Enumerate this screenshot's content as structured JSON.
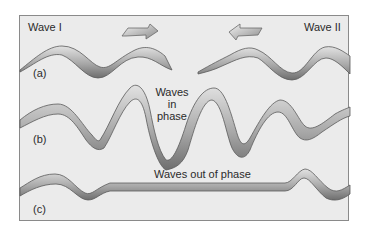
{
  "figure": {
    "labels": {
      "wave_1": "Wave I",
      "wave_2": "Wave II",
      "panel_a": "(a)",
      "panel_b": "(b)",
      "panel_c": "(c)",
      "in_phase_line1": "Waves",
      "in_phase_line2": "in",
      "in_phase_line3": "phase",
      "out_of_phase": "Waves out of phase"
    },
    "arrows": [
      {
        "name": "right-arrow",
        "direction": "right",
        "meaning": "Wave I travels right"
      },
      {
        "name": "left-arrow",
        "direction": "left",
        "meaning": "Wave II travels left"
      }
    ],
    "panels": [
      {
        "id": "a",
        "description": "Two separate waves approaching each other"
      },
      {
        "id": "b",
        "description": "Constructive interference: amplitudes add"
      },
      {
        "id": "c",
        "description": "Destructive interference: waves cancel"
      }
    ],
    "colors": {
      "background": "#ebebeb",
      "frame_border": "#8a8a8a",
      "ribbon_light": "#d6d6d6",
      "ribbon_dark": "#7c7c7c",
      "outline": "#5a5a5a",
      "text": "#2a2a2a"
    }
  }
}
